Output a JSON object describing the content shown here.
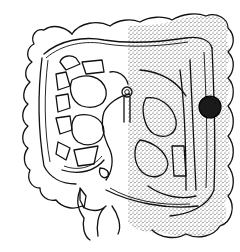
{
  "figure": {
    "style": "black-line-drawing",
    "shaded_region": {
      "side": "right-half",
      "pattern": "stipple",
      "color": "#444444"
    },
    "marker": {
      "shape": "filled-circle",
      "color": "#1a1a1a",
      "cx": 210,
      "cy": 107,
      "r": 11
    },
    "colors": {
      "background": "#ffffff",
      "line": "#111111"
    }
  }
}
